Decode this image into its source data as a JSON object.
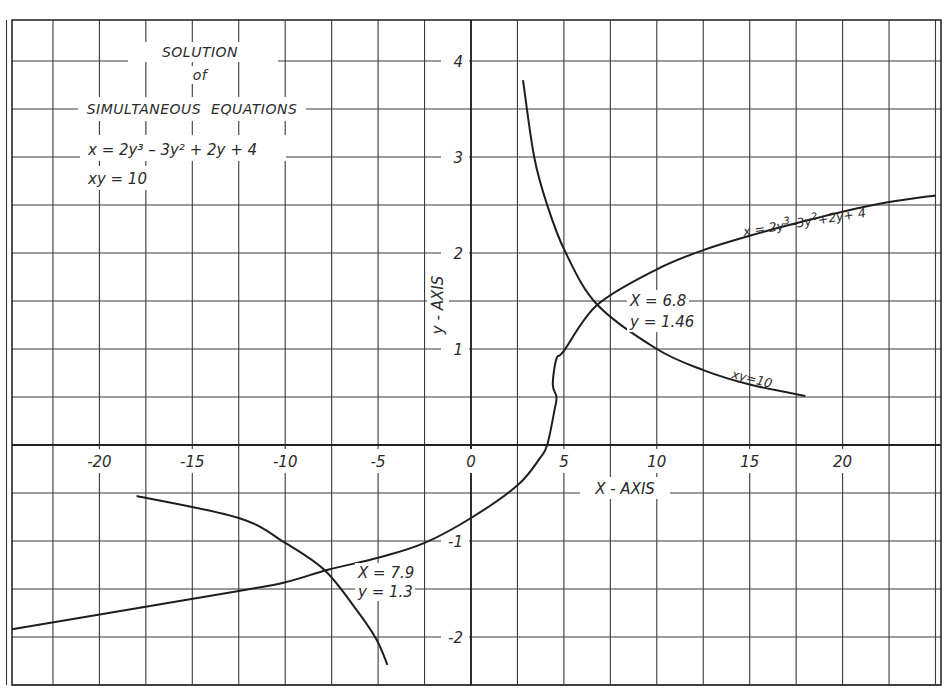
{
  "chart_data": {
    "type": "line",
    "title_lines": [
      "SOLUTION",
      "of",
      "SIMULTANEOUS  EQUATIONS"
    ],
    "equations": [
      "x = 2y³ – 3y² + 2y + 4",
      "xy = 10"
    ],
    "xlabel": "X - AXIS",
    "ylabel": "y - AXIS",
    "xlim": [
      -25,
      25
    ],
    "ylim": [
      -2.5,
      4.5
    ],
    "grid": true,
    "grid_step_x": 2.5,
    "grid_step_y": 0.5,
    "x_ticks": [
      {
        "value": -20,
        "label": "-20"
      },
      {
        "value": -15,
        "label": "-15"
      },
      {
        "value": -10,
        "label": "-10"
      },
      {
        "value": -5,
        "label": "-5"
      },
      {
        "value": 0,
        "label": "0"
      },
      {
        "value": 5,
        "label": "5"
      },
      {
        "value": 10,
        "label": "10"
      },
      {
        "value": 15,
        "label": "15"
      },
      {
        "value": 20,
        "label": "20"
      }
    ],
    "y_ticks": [
      {
        "value": 4,
        "label": "4"
      },
      {
        "value": 3,
        "label": "3"
      },
      {
        "value": 2,
        "label": "2"
      },
      {
        "value": 1,
        "label": "1"
      },
      {
        "value": -1,
        "label": "-1"
      },
      {
        "value": -2,
        "label": "-2"
      }
    ],
    "series": [
      {
        "name": "x = 2y³–3y²+2y+ 4",
        "label_parts": [
          "x = 2y",
          "3",
          "–3y",
          "2",
          "+2y+ 4"
        ],
        "points": [
          [
            -24.7,
            -1.92
          ],
          [
            -12.5,
            -1.52
          ],
          [
            -10,
            -1.43
          ],
          [
            -7.7,
            -1.3
          ],
          [
            -4.9,
            -1.17
          ],
          [
            -2.5,
            -1.02
          ],
          [
            0,
            -0.76
          ],
          [
            2.5,
            -0.42
          ],
          [
            3.7,
            -0.14
          ],
          [
            4.1,
            0.0
          ],
          [
            4.5,
            0.37
          ],
          [
            4.6,
            0.5
          ],
          [
            4.4,
            0.63
          ],
          [
            4.6,
            0.9
          ],
          [
            5.0,
            0.98
          ],
          [
            6.8,
            1.46
          ],
          [
            10,
            1.83
          ],
          [
            12.5,
            2.03
          ],
          [
            15,
            2.18
          ],
          [
            17.5,
            2.31
          ],
          [
            20,
            2.43
          ],
          [
            22.5,
            2.53
          ],
          [
            25,
            2.6
          ]
        ]
      },
      {
        "name": "xy=10",
        "label": "xy=10",
        "branches": [
          [
            [
              2.8,
              3.8
            ],
            [
              3.4,
              3.0
            ],
            [
              4.1,
              2.5
            ],
            [
              5.1,
              2.0
            ],
            [
              6.8,
              1.46
            ],
            [
              10,
              1.0
            ],
            [
              12.5,
              0.78
            ],
            [
              15,
              0.63
            ],
            [
              18,
              0.51
            ]
          ],
          [
            [
              -18,
              -0.53
            ],
            [
              -12.5,
              -0.76
            ],
            [
              -10,
              -1.02
            ],
            [
              -7.9,
              -1.3
            ],
            [
              -6.3,
              -1.68
            ],
            [
              -5.1,
              -2.02
            ],
            [
              -4.5,
              -2.29
            ]
          ]
        ]
      }
    ],
    "annotations": [
      {
        "line1": "X = 6.8",
        "line2": "y = 1.46",
        "point": [
          6.8,
          1.46
        ]
      },
      {
        "line1": "X = 7.9",
        "line2": "y = 1.3",
        "point": [
          -7.9,
          -1.3
        ]
      }
    ],
    "legend_position": "none"
  }
}
